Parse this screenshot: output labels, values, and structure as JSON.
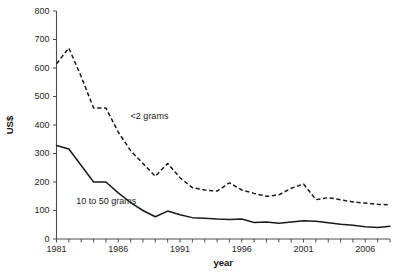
{
  "chart_data": {
    "type": "line",
    "title": "",
    "xlabel": "year",
    "ylabel": "US$",
    "xlim": [
      1981,
      2008
    ],
    "ylim": [
      0,
      800
    ],
    "grid": false,
    "legend_position": "inline-annotation",
    "x": [
      1981,
      1982,
      1983,
      1984,
      1985,
      1986,
      1987,
      1988,
      1989,
      1990,
      1991,
      1992,
      1993,
      1994,
      1995,
      1996,
      1997,
      1998,
      1999,
      2000,
      2001,
      2002,
      2003,
      2004,
      2005,
      2006,
      2007,
      2008
    ],
    "x_tick_values": [
      1981,
      1982,
      1983,
      1984,
      1985,
      1986,
      1987,
      1988,
      1989,
      1990,
      1991,
      1992,
      1993,
      1994,
      1995,
      1996,
      1997,
      1998,
      1999,
      2000,
      2001,
      2002,
      2003,
      2004,
      2005,
      2006,
      2007,
      2008
    ],
    "x_tick_labels": [
      {
        "value": 1981,
        "label": "1981"
      },
      {
        "value": 1986,
        "label": "1986"
      },
      {
        "value": 1991,
        "label": "1991"
      },
      {
        "value": 1996,
        "label": "1996"
      },
      {
        "value": 2001,
        "label": "2001"
      },
      {
        "value": 2006,
        "label": "2006"
      }
    ],
    "y_tick_values": [
      0,
      100,
      200,
      300,
      400,
      500,
      600,
      700,
      800
    ],
    "y_tick_labels": [
      "0",
      "100",
      "200",
      "300",
      "400",
      "500",
      "600",
      "700",
      "800"
    ],
    "series": [
      {
        "name": "<2 grams",
        "style": "dashed",
        "color": "#1a1a1a",
        "label_x": 1987.0,
        "label_y": 420,
        "values": [
          615,
          670,
          570,
          460,
          460,
          375,
          310,
          265,
          220,
          265,
          215,
          180,
          172,
          168,
          197,
          172,
          160,
          150,
          155,
          178,
          193,
          138,
          145,
          138,
          130,
          126,
          122,
          120
        ]
      },
      {
        "name": "10 to 50 grams",
        "style": "solid",
        "color": "#1a1a1a",
        "label_x": 1982.6,
        "label_y": 122,
        "values": [
          328,
          316,
          258,
          200,
          200,
          162,
          128,
          100,
          78,
          98,
          85,
          75,
          73,
          70,
          68,
          70,
          58,
          60,
          55,
          60,
          64,
          62,
          57,
          52,
          48,
          43,
          40,
          45
        ]
      }
    ]
  }
}
